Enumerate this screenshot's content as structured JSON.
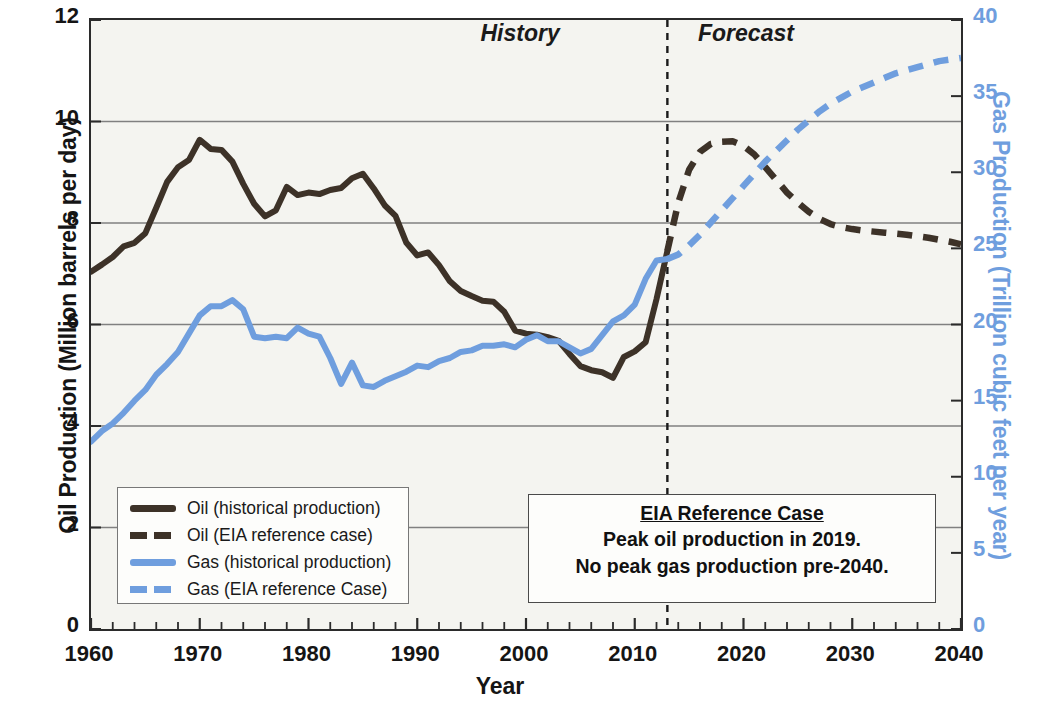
{
  "chart_data": {
    "type": "line",
    "title": "",
    "xlabel": "Year",
    "ylabel": "Oil Production (Million barrels per day)",
    "y2label": "Gas Production (Trillion cubic feet per year)",
    "xlim": [
      1960,
      2040
    ],
    "ylim": [
      0,
      12
    ],
    "y2lim": [
      0,
      40
    ],
    "xticks": [
      "1960",
      "1970",
      "1980",
      "1990",
      "2000",
      "2010",
      "2020",
      "2030",
      "2040"
    ],
    "yticks": [
      "0",
      "2",
      "4",
      "6",
      "8",
      "10",
      "12"
    ],
    "y2ticks": [
      "0",
      "5",
      "10",
      "15",
      "20",
      "25",
      "30",
      "35",
      "40"
    ],
    "x_minor_tick_step": 2,
    "grid": "horizontal",
    "legend_position": "lower-left",
    "divider_year": 2013,
    "era_labels": [
      "History",
      "Forecast"
    ],
    "series": [
      {
        "name": "Oil (historical production)",
        "axis": "left",
        "style": "solid",
        "color": "#3d3228",
        "unit": "Million barrels per day",
        "x": [
          1960,
          1961,
          1962,
          1963,
          1964,
          1965,
          1966,
          1967,
          1968,
          1969,
          1970,
          1971,
          1972,
          1973,
          1974,
          1975,
          1976,
          1977,
          1978,
          1979,
          1980,
          1981,
          1982,
          1983,
          1984,
          1985,
          1986,
          1987,
          1988,
          1989,
          1990,
          1991,
          1992,
          1993,
          1994,
          1995,
          1996,
          1997,
          1998,
          1999,
          2000,
          2001,
          2002,
          2003,
          2004,
          2005,
          2006,
          2007,
          2008,
          2009,
          2010,
          2011,
          2012,
          2013
        ],
        "y": [
          7.04,
          7.18,
          7.33,
          7.54,
          7.61,
          7.8,
          8.3,
          8.81,
          9.1,
          9.24,
          9.64,
          9.46,
          9.44,
          9.21,
          8.77,
          8.38,
          8.13,
          8.25,
          8.71,
          8.55,
          8.6,
          8.57,
          8.65,
          8.69,
          8.88,
          8.97,
          8.68,
          8.35,
          8.14,
          7.61,
          7.36,
          7.42,
          7.17,
          6.85,
          6.66,
          6.56,
          6.47,
          6.45,
          6.25,
          5.88,
          5.82,
          5.8,
          5.75,
          5.68,
          5.42,
          5.18,
          5.1,
          5.06,
          4.95,
          5.36,
          5.47,
          5.65,
          6.5,
          7.45
        ]
      },
      {
        "name": "Oil (EIA reference case)",
        "axis": "left",
        "style": "dashed",
        "color": "#3d3228",
        "unit": "Million barrels per day",
        "x": [
          2013,
          2014,
          2015,
          2016,
          2017,
          2018,
          2019,
          2020,
          2021,
          2022,
          2023,
          2024,
          2025,
          2026,
          2027,
          2028,
          2029,
          2030,
          2031,
          2032,
          2033,
          2034,
          2035,
          2036,
          2037,
          2038,
          2039,
          2040
        ],
        "y": [
          7.45,
          8.4,
          9.05,
          9.4,
          9.56,
          9.6,
          9.61,
          9.52,
          9.35,
          9.1,
          8.85,
          8.6,
          8.4,
          8.22,
          8.08,
          7.98,
          7.92,
          7.88,
          7.85,
          7.83,
          7.81,
          7.79,
          7.77,
          7.74,
          7.71,
          7.67,
          7.63,
          7.58
        ]
      },
      {
        "name": "Gas (historical production)",
        "axis": "right",
        "style": "solid",
        "color": "#6f9ede",
        "unit": "Trillion cubic feet per year",
        "x": [
          1960,
          1961,
          1962,
          1963,
          1964,
          1965,
          1966,
          1967,
          1968,
          1969,
          1970,
          1971,
          1972,
          1973,
          1974,
          1975,
          1976,
          1977,
          1978,
          1979,
          1980,
          1981,
          1982,
          1983,
          1984,
          1985,
          1986,
          1987,
          1988,
          1989,
          1990,
          1991,
          1992,
          1993,
          1994,
          1995,
          1996,
          1997,
          1998,
          1999,
          2000,
          2001,
          2002,
          2003,
          2004,
          2005,
          2006,
          2007,
          2008,
          2009,
          2010,
          2011,
          2012,
          2013
        ],
        "y": [
          12.3,
          13.0,
          13.5,
          14.2,
          15.0,
          15.7,
          16.7,
          17.4,
          18.2,
          19.4,
          20.6,
          21.2,
          21.2,
          21.6,
          21.0,
          19.2,
          19.1,
          19.2,
          19.1,
          19.8,
          19.4,
          19.2,
          17.8,
          16.1,
          17.5,
          16.0,
          15.9,
          16.3,
          16.6,
          16.9,
          17.3,
          17.2,
          17.6,
          17.8,
          18.2,
          18.3,
          18.6,
          18.6,
          18.7,
          18.5,
          19.0,
          19.3,
          18.9,
          18.9,
          18.5,
          18.1,
          18.4,
          19.3,
          20.2,
          20.6,
          21.3,
          23.0,
          24.2,
          24.3
        ]
      },
      {
        "name": "Gas (EIA reference Case)",
        "axis": "right",
        "style": "dashed",
        "color": "#6f9ede",
        "unit": "Trillion cubic feet per year",
        "x": [
          2013,
          2014,
          2015,
          2016,
          2017,
          2018,
          2019,
          2020,
          2021,
          2022,
          2023,
          2024,
          2025,
          2026,
          2027,
          2028,
          2029,
          2030,
          2031,
          2032,
          2033,
          2034,
          2035,
          2036,
          2037,
          2038,
          2039,
          2040
        ],
        "y": [
          24.3,
          24.6,
          25.2,
          25.9,
          26.7,
          27.5,
          28.3,
          29.1,
          29.9,
          30.7,
          31.4,
          32.1,
          32.8,
          33.4,
          34.0,
          34.5,
          34.9,
          35.3,
          35.6,
          35.9,
          36.2,
          36.5,
          36.7,
          36.9,
          37.1,
          37.3,
          37.4,
          37.5
        ]
      }
    ],
    "annotation": {
      "title": "EIA Reference Case",
      "line2": "Peak  oil production in 2019.",
      "line3": "No peak gas production pre-2040."
    }
  },
  "axes": {
    "left_title": "Oil Production (Million barrels per day)",
    "right_title": "Gas Production (Trillion cubic feet per year)",
    "x_title": "Year"
  },
  "eras": {
    "history": "History",
    "forecast": "Forecast"
  },
  "legend": {
    "items": [
      {
        "label": "Oil (historical production)",
        "color": "#3d3228",
        "style": "solid"
      },
      {
        "label": "Oil (EIA reference case)",
        "color": "#3d3228",
        "style": "dashed"
      },
      {
        "label": "Gas (historical production)",
        "color": "#6f9ede",
        "style": "solid"
      },
      {
        "label": "Gas (EIA reference Case)",
        "color": "#6f9ede",
        "style": "dashed"
      }
    ]
  },
  "annotation": {
    "title": "EIA Reference Case",
    "line2": "Peak  oil production in 2019.",
    "line3": "No peak gas production pre-2040."
  },
  "colors": {
    "oil": "#3d3228",
    "gas": "#6f9ede",
    "axis": "#2b2b2b",
    "grid": "#808080",
    "plot_bg": "#f4f4f0"
  }
}
